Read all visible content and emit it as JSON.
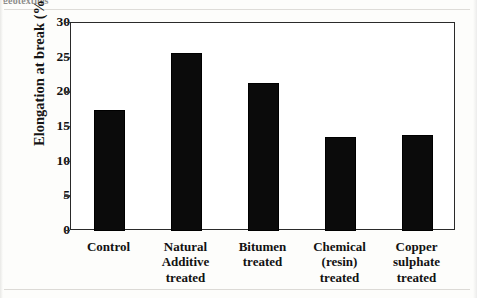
{
  "caption_clipped_text": "geotextiles",
  "chart_data": {
    "type": "bar",
    "title": "",
    "xlabel": "",
    "ylabel": "Elongation at break (%)",
    "categories": [
      "Control",
      "Natural\nAdditive\ntreated",
      "Bitumen\ntreated",
      "Chemical\n(resin)\ntreated",
      "Copper\nsulphate\ntreated"
    ],
    "category_lines": [
      [
        "Control"
      ],
      [
        "Natural",
        "Additive",
        "treated"
      ],
      [
        "Bitumen",
        "treated"
      ],
      [
        "Chemical",
        "(resin)",
        "treated"
      ],
      [
        "Copper",
        "sulphate",
        "treated"
      ]
    ],
    "values": [
      17.5,
      25.7,
      21.4,
      13.5,
      13.8
    ],
    "ylim": [
      0,
      30
    ],
    "ytick_labels": [
      "30",
      "25",
      "20",
      "15",
      "10",
      "5",
      "0"
    ],
    "ytick_values": [
      30,
      25,
      20,
      15,
      10,
      5,
      0
    ],
    "grid": false,
    "legend": false,
    "bar_color": "#0b0b0b",
    "frame_color": "#2a2a2a",
    "background_color": "#ffffff"
  }
}
